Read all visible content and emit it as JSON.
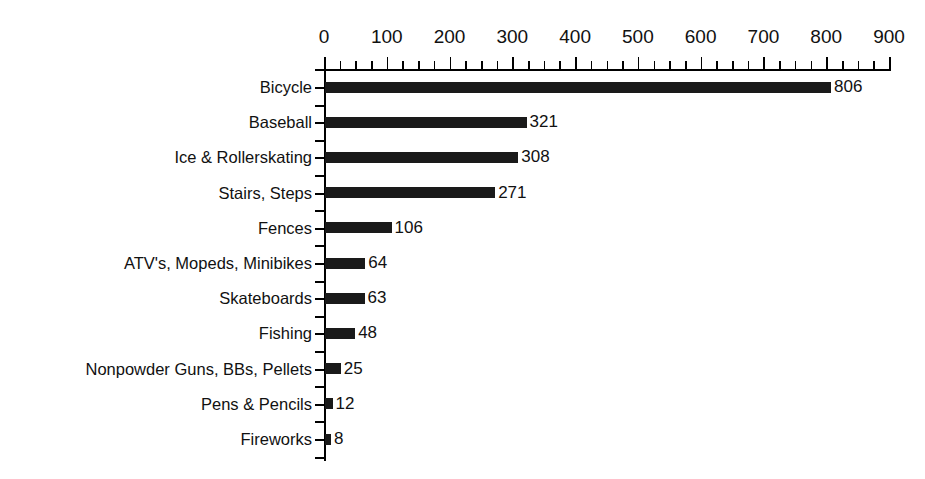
{
  "chart_data": {
    "type": "bar",
    "orientation": "horizontal",
    "title": "",
    "subtitle": "",
    "xlabel": "",
    "ylabel": "",
    "xlim": [
      0,
      900
    ],
    "ylim": null,
    "grid": false,
    "legend": null,
    "legend_position": "none",
    "x_major_tick_step": 100,
    "x_minor_tick_step": 25,
    "x_tick_labels": [
      "0",
      "100",
      "200",
      "300",
      "400",
      "500",
      "600",
      "700",
      "800",
      "900"
    ],
    "x_tick_values": [
      0,
      100,
      200,
      300,
      400,
      500,
      600,
      700,
      800,
      900
    ],
    "categories": [
      "Bicycle",
      "Baseball",
      "Ice & Rollerskating",
      "Stairs, Steps",
      "Fences",
      "ATV's, Mopeds, Minibikes",
      "Skateboards",
      "Fishing",
      "Nonpowder Guns, BBs, Pellets",
      "Pens & Pencils",
      "Fireworks"
    ],
    "values": [
      806,
      321,
      308,
      271,
      106,
      64,
      63,
      48,
      25,
      12,
      8
    ],
    "value_labels": [
      "806",
      "321",
      "308",
      "271",
      "106",
      "64",
      "63",
      "48",
      "25",
      "12",
      "8"
    ],
    "bar_color": "#1a1a1a",
    "axis_color": "#000000",
    "background_color": "#ffffff"
  }
}
